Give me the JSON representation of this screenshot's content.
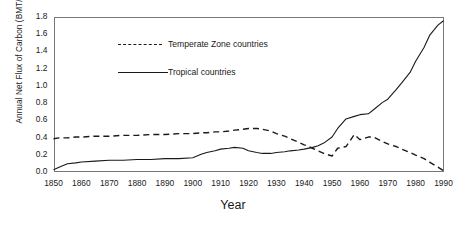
{
  "chart_data": {
    "type": "line",
    "title": "",
    "xlabel": "Year",
    "ylabel": "Annual Net Flux of Carbon (BMT/yr)",
    "xlim": [
      1850,
      1990
    ],
    "ylim": [
      0.0,
      1.8
    ],
    "grid": false,
    "legend_position": "inside-top-left",
    "xticks": [
      1850,
      1860,
      1870,
      1880,
      1890,
      1900,
      1910,
      1920,
      1930,
      1940,
      1950,
      1960,
      1970,
      1980,
      1990
    ],
    "yticks": [
      "0.0",
      "0.2",
      "0.4",
      "0.6",
      "0.8",
      "1.0",
      "1.2",
      "1.4",
      "1.6",
      "1.8"
    ],
    "x": [
      1850,
      1852,
      1855,
      1858,
      1860,
      1865,
      1870,
      1875,
      1880,
      1885,
      1890,
      1895,
      1900,
      1903,
      1905,
      1908,
      1910,
      1913,
      1915,
      1918,
      1920,
      1923,
      1925,
      1928,
      1930,
      1933,
      1935,
      1938,
      1940,
      1943,
      1945,
      1947,
      1950,
      1952,
      1955,
      1958,
      1960,
      1963,
      1965,
      1968,
      1970,
      1973,
      1975,
      1978,
      1980,
      1983,
      1985,
      1988,
      1990
    ],
    "series": [
      {
        "name": "Temperate Zone countries",
        "style": "dashed",
        "color": "#1a1a1a",
        "values": [
          0.38,
          0.39,
          0.39,
          0.4,
          0.4,
          0.41,
          0.41,
          0.42,
          0.42,
          0.43,
          0.43,
          0.44,
          0.44,
          0.45,
          0.45,
          0.46,
          0.46,
          0.47,
          0.48,
          0.49,
          0.5,
          0.5,
          0.49,
          0.47,
          0.44,
          0.41,
          0.38,
          0.34,
          0.31,
          0.27,
          0.24,
          0.21,
          0.18,
          0.27,
          0.29,
          0.43,
          0.37,
          0.4,
          0.4,
          0.35,
          0.32,
          0.29,
          0.26,
          0.22,
          0.19,
          0.15,
          0.11,
          0.05,
          0.01
        ]
      },
      {
        "name": "Tropical countries",
        "style": "solid",
        "color": "#1a1a1a",
        "values": [
          0.02,
          0.05,
          0.09,
          0.1,
          0.11,
          0.12,
          0.13,
          0.13,
          0.14,
          0.14,
          0.15,
          0.15,
          0.16,
          0.2,
          0.22,
          0.24,
          0.26,
          0.27,
          0.28,
          0.27,
          0.24,
          0.22,
          0.21,
          0.21,
          0.22,
          0.23,
          0.24,
          0.25,
          0.26,
          0.28,
          0.3,
          0.33,
          0.4,
          0.5,
          0.61,
          0.64,
          0.66,
          0.67,
          0.72,
          0.8,
          0.84,
          0.95,
          1.03,
          1.15,
          1.28,
          1.44,
          1.58,
          1.7,
          1.75
        ]
      }
    ],
    "legend": [
      {
        "label": "Temperate Zone countries",
        "style": "dashed"
      },
      {
        "label": "Tropical countries",
        "style": "solid"
      }
    ]
  }
}
